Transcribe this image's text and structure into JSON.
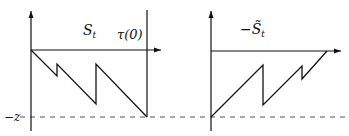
{
  "left_panel": {
    "label_main": "S",
    "label_sub": "t",
    "tau_label": "τ(0)",
    "level_label": "−z",
    "path_points": [
      [
        31,
        50
      ],
      [
        57,
        76
      ],
      [
        57,
        64
      ],
      [
        96,
        104
      ],
      [
        96,
        64
      ],
      [
        147,
        117
      ]
    ]
  },
  "right_panel": {
    "label_prefix": "−",
    "label_main": "S̃",
    "label_sub": "t",
    "path_points": [
      [
        211,
        117
      ],
      [
        263,
        65
      ],
      [
        263,
        105
      ],
      [
        302,
        66
      ],
      [
        302,
        79
      ],
      [
        327,
        51
      ]
    ]
  },
  "colors": {
    "stroke": "#111111",
    "dash": "#555555",
    "background": "#ffffff"
  }
}
